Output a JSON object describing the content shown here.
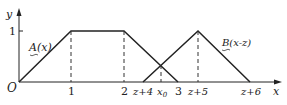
{
  "figure": {
    "type": "fuzzy membership functions",
    "axes": {
      "x_label": "x",
      "y_label": "y",
      "origin_label": "O",
      "y_tick": "1"
    },
    "x_ticks": [
      "1",
      "2",
      "z+4",
      "x0",
      "3",
      "z+5",
      "z+6"
    ],
    "curves": [
      {
        "name": "A(x)",
        "label": "A(x)",
        "shape": "trapezoid",
        "points": [
          [
            0,
            0
          ],
          [
            1,
            1
          ],
          [
            2,
            1
          ],
          [
            3,
            0
          ]
        ]
      },
      {
        "name": "B(x-z)",
        "label": "B(x-z)",
        "shape": "triangle",
        "points": [
          [
            "z+4",
            0
          ],
          [
            "z+5",
            1
          ],
          [
            "z+6",
            0
          ]
        ]
      }
    ],
    "intersection": "x0",
    "colors": {
      "line": "#222222",
      "background": "#ffffff"
    }
  },
  "labels": {
    "y": "y",
    "x": "x",
    "origin": "O",
    "one": "1",
    "t1": "1",
    "t2": "2",
    "t3": "3",
    "tz4": "z+4",
    "tx0": "x",
    "tx0sub": "0",
    "tz5": "z+5",
    "tz6": "z+6",
    "curveA": "A(x)",
    "curveB": "B(x-z)"
  }
}
